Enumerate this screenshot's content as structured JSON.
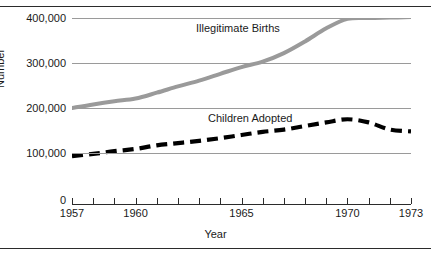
{
  "chart_data": {
    "type": "line",
    "title": "",
    "xlabel": "Year",
    "ylabel": "Number",
    "xlim": [
      1957,
      1973
    ],
    "ylim": [
      0,
      400000
    ],
    "grid": true,
    "legend_position": "inline-labels",
    "y_ticks": [
      {
        "value": 0,
        "label": "0"
      },
      {
        "value": 100000,
        "label": "100,000"
      },
      {
        "value": 200000,
        "label": "200,000"
      },
      {
        "value": 300000,
        "label": "300,000"
      },
      {
        "value": 400000,
        "label": "400,000"
      }
    ],
    "x_ticks": [
      1957,
      1958,
      1959,
      1960,
      1961,
      1962,
      1963,
      1964,
      1965,
      1966,
      1967,
      1968,
      1969,
      1970,
      1971,
      1972,
      1973
    ],
    "x_tick_labels": [
      {
        "value": 1957,
        "label": "1957"
      },
      {
        "value": 1960,
        "label": "1960"
      },
      {
        "value": 1965,
        "label": "1965"
      },
      {
        "value": 1970,
        "label": "1970"
      },
      {
        "value": 1973,
        "label": "1973"
      }
    ],
    "x": [
      1957,
      1958,
      1959,
      1960,
      1961,
      1962,
      1963,
      1964,
      1965,
      1966,
      1967,
      1968,
      1969,
      1970,
      1971,
      1972,
      1973
    ],
    "series": [
      {
        "name": "Illegitimate Births",
        "color": "#9a9a9a",
        "style": "solid",
        "values": [
          200000,
          208000,
          215000,
          221000,
          234000,
          248000,
          261000,
          276000,
          291000,
          303000,
          322000,
          348000,
          377000,
          398000,
          400000,
          401000,
          402000
        ]
      },
      {
        "name": "Children Adopted",
        "color": "#000000",
        "style": "dashed",
        "values": [
          93000,
          98000,
          104000,
          109000,
          117000,
          122000,
          127000,
          133000,
          140000,
          147000,
          152000,
          160000,
          168000,
          175000,
          168000,
          152000,
          148000
        ]
      }
    ],
    "annotations": [
      {
        "text": "Illegitimate Births",
        "series": "Illegitimate Births"
      },
      {
        "text": "Children Adopted",
        "series": "Children Adopted"
      }
    ]
  }
}
